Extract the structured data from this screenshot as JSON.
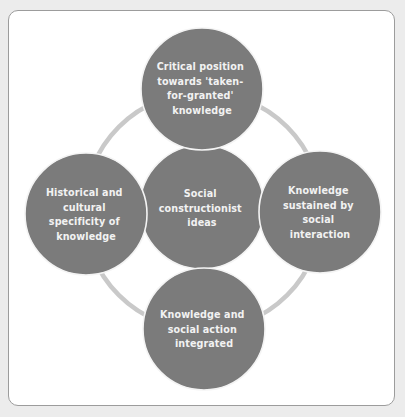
{
  "diagram": {
    "type": "cycle-with-hub",
    "colors": {
      "background": "#ececec",
      "panel": "#ffffff",
      "panel_border": "#9c9c9c",
      "node_fill": "#7b7b7b",
      "node_text": "#f2f2f2",
      "ring": "#c9c9c9"
    },
    "center": {
      "id": "center",
      "lines": [
        "Social",
        "constructionist",
        "ideas"
      ]
    },
    "nodes": [
      {
        "id": "top",
        "position": "top",
        "lines": [
          "Critical position",
          "towards 'taken-",
          "for-granted'",
          "knowledge"
        ]
      },
      {
        "id": "right",
        "position": "right",
        "lines": [
          "Knowledge",
          "sustained by",
          "social",
          "interaction"
        ]
      },
      {
        "id": "bottom",
        "position": "bottom",
        "lines": [
          "Knowledge and",
          "social action",
          "integrated"
        ]
      },
      {
        "id": "left",
        "position": "left",
        "lines": [
          "Historical and",
          "cultural",
          "specificity of",
          "knowledge"
        ]
      }
    ]
  }
}
